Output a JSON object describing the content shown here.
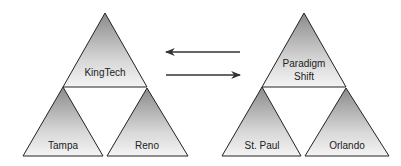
{
  "diagram": {
    "type": "domain-trust-diagram",
    "colors": {
      "triangle_fill_top": "#8f8f8f",
      "triangle_fill_bottom": "#f2f2f2",
      "outline": "#222222",
      "arrow": "#333333"
    },
    "left_tree": {
      "root": {
        "label": "KingTech"
      },
      "children": [
        {
          "label": "Tampa"
        },
        {
          "label": "Reno"
        }
      ]
    },
    "right_tree": {
      "root": {
        "label_line1": "Paradigm",
        "label_line2": "Shift"
      },
      "children": [
        {
          "label": "St. Paul"
        },
        {
          "label": "Orlando"
        }
      ]
    },
    "arrows": [
      {
        "direction": "left",
        "from": "right_tree",
        "to": "left_tree"
      },
      {
        "direction": "right",
        "from": "left_tree",
        "to": "right_tree"
      }
    ]
  }
}
